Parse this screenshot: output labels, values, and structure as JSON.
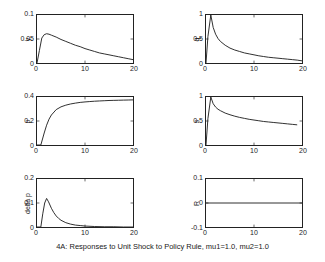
{
  "caption": "4A: Responses to Unit Shock to Policy Rule, mu1=1.0, mu2=1.0",
  "chart_data": {
    "type": "line",
    "title": "4A: Responses to Unit Shock to Policy Rule, mu1=1.0, mu2=1.0",
    "layout": {
      "rows": 3,
      "cols": 2,
      "grid": false,
      "legend": "none",
      "line_color": "#1a1a1a"
    },
    "shared_x": {
      "label": "",
      "ticks": [
        0,
        10,
        20
      ],
      "xlim": [
        0,
        20
      ]
    },
    "panels": [
      {
        "id": "y",
        "ylabel": "y",
        "position": "top-left",
        "ylim": [
          0,
          0.1
        ],
        "yticks": [
          0,
          0.05,
          0.1
        ],
        "yticklabels": [
          "0",
          "0.05",
          "0.1"
        ],
        "xlim": [
          0,
          20
        ],
        "xticks": [
          0,
          10,
          20
        ],
        "xticklabels": [
          "0",
          "10",
          "20"
        ],
        "x": [
          0,
          0.5,
          1,
          1.5,
          2,
          2.5,
          3,
          4,
          5,
          6,
          7,
          8,
          9,
          10,
          11,
          12,
          13,
          14,
          15,
          16,
          17,
          18,
          19,
          20
        ],
        "values": [
          0,
          0.026,
          0.052,
          0.059,
          0.061,
          0.06,
          0.058,
          0.054,
          0.049,
          0.045,
          0.041,
          0.037,
          0.034,
          0.03,
          0.027,
          0.024,
          0.021,
          0.019,
          0.017,
          0.015,
          0.013,
          0.011,
          0.009,
          0.007
        ]
      },
      {
        "id": "q",
        "ylabel": "q",
        "position": "top-right",
        "ylim": [
          0,
          1
        ],
        "yticks": [
          0,
          0.5,
          1
        ],
        "yticklabels": [
          "0",
          "0.5",
          "1"
        ],
        "xlim": [
          0,
          20
        ],
        "xticks": [
          0,
          10,
          20
        ],
        "xticklabels": [
          "0",
          "10",
          "20"
        ],
        "x": [
          0,
          0.4,
          1,
          1.5,
          2,
          2.5,
          3,
          4,
          5,
          6,
          7,
          8,
          9,
          10,
          11,
          12,
          13,
          14,
          15,
          16,
          17,
          18,
          19,
          20
        ],
        "values": [
          0,
          0.55,
          1.0,
          0.74,
          0.6,
          0.51,
          0.45,
          0.37,
          0.31,
          0.27,
          0.24,
          0.21,
          0.19,
          0.17,
          0.15,
          0.135,
          0.12,
          0.11,
          0.1,
          0.09,
          0.08,
          0.07,
          0.06,
          0.045
        ]
      },
      {
        "id": "p",
        "ylabel": "p",
        "position": "middle-left",
        "ylim": [
          0,
          0.4
        ],
        "yticks": [
          0,
          0.2,
          0.4
        ],
        "yticklabels": [
          "0",
          "0.2",
          "0.4"
        ],
        "xlim": [
          0,
          20
        ],
        "xticks": [
          0,
          10,
          20
        ],
        "xticklabels": [
          "0",
          "10",
          "20"
        ],
        "x": [
          0,
          0.8,
          1.5,
          2,
          2.5,
          3,
          4,
          5,
          6,
          7,
          8,
          9,
          10,
          11,
          12,
          13,
          14,
          15,
          16,
          17,
          18,
          19,
          20
        ],
        "values": [
          0,
          0.0,
          0.1,
          0.165,
          0.215,
          0.25,
          0.295,
          0.318,
          0.332,
          0.342,
          0.349,
          0.355,
          0.359,
          0.362,
          0.365,
          0.367,
          0.369,
          0.371,
          0.372,
          0.373,
          0.374,
          0.375,
          0.376
        ]
      },
      {
        "id": "s",
        "ylabel": "s",
        "position": "middle-right",
        "ylim": [
          0,
          1
        ],
        "yticks": [
          0,
          0.5,
          1
        ],
        "yticklabels": [
          "0",
          "0.5",
          "1"
        ],
        "xlim": [
          0,
          20
        ],
        "xticks": [
          0,
          10,
          20
        ],
        "xticklabels": [
          "0",
          "10",
          "20"
        ],
        "x": [
          0,
          0.4,
          1,
          1.5,
          2,
          2.5,
          3,
          4,
          5,
          6,
          7,
          8,
          9,
          10,
          11,
          12,
          13,
          14,
          15,
          16,
          17,
          18,
          19,
          20
        ],
        "values": [
          0,
          0.55,
          1.0,
          0.86,
          0.79,
          0.745,
          0.715,
          0.665,
          0.63,
          0.6,
          0.575,
          0.555,
          0.535,
          0.52,
          0.505,
          0.49,
          0.48,
          0.47,
          0.46,
          0.45,
          0.44,
          0.43,
          0.42
        ]
      },
      {
        "id": "delta_p",
        "ylabel": "delta p",
        "position": "bottom-left",
        "ylim": [
          0,
          0.2
        ],
        "yticks": [
          0,
          0.1,
          0.2
        ],
        "yticklabels": [
          "0",
          "0.1",
          "0.2"
        ],
        "xlim": [
          0,
          20
        ],
        "xticks": [
          0,
          10,
          20
        ],
        "xticklabels": [
          "0",
          "10",
          "20"
        ],
        "x": [
          0,
          0.8,
          1.2,
          1.6,
          2,
          2.4,
          3,
          3.5,
          4,
          4.5,
          5,
          6,
          7,
          8,
          9,
          10,
          12,
          14,
          16,
          18,
          20
        ],
        "values": [
          0,
          0.0,
          0.055,
          0.1,
          0.119,
          0.105,
          0.078,
          0.06,
          0.046,
          0.036,
          0.028,
          0.018,
          0.012,
          0.008,
          0.006,
          0.004,
          0.002,
          0.001,
          0.001,
          0.0,
          0.0
        ]
      },
      {
        "id": "R",
        "ylabel": "R",
        "position": "bottom-right",
        "ylim": [
          -0.1,
          0.1
        ],
        "yticks": [
          -0.1,
          0,
          0.1
        ],
        "yticklabels": [
          "-0.1",
          "0",
          "0.1"
        ],
        "xlim": [
          0,
          20
        ],
        "xticks": [
          0,
          10,
          20
        ],
        "xticklabels": [
          "0",
          "10",
          "20"
        ],
        "x": [
          0,
          5,
          10,
          15,
          20
        ],
        "values": [
          0,
          0,
          0,
          0,
          0
        ]
      }
    ]
  }
}
